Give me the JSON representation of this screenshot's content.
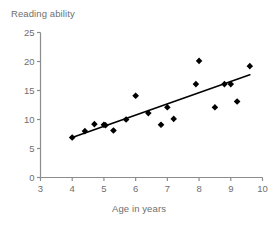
{
  "chart_data": {
    "type": "scatter",
    "title": "",
    "xlabel": "Age in years",
    "ylabel": "Reading ability",
    "xlim": [
      3,
      10
    ],
    "ylim": [
      0,
      25
    ],
    "xticks": [
      3,
      4,
      5,
      6,
      7,
      8,
      9,
      10
    ],
    "yticks": [
      0,
      5,
      10,
      15,
      20,
      25
    ],
    "grid": false,
    "legend": "none",
    "marker": "diamond",
    "marker_color": "#000000",
    "axis_color": "#8c8c8c",
    "trendline": {
      "label": "",
      "color": "#000000",
      "x": [
        4.0,
        9.6
      ],
      "y": [
        6.9,
        17.7
      ]
    },
    "points": [
      {
        "x": 4.0,
        "y": 6.9
      },
      {
        "x": 4.4,
        "y": 8.0
      },
      {
        "x": 4.7,
        "y": 9.2
      },
      {
        "x": 5.0,
        "y": 9.1
      },
      {
        "x": 5.05,
        "y": 9.0
      },
      {
        "x": 5.3,
        "y": 8.1
      },
      {
        "x": 5.7,
        "y": 10.0
      },
      {
        "x": 6.0,
        "y": 14.1
      },
      {
        "x": 6.4,
        "y": 11.1
      },
      {
        "x": 6.8,
        "y": 9.1
      },
      {
        "x": 7.0,
        "y": 12.1
      },
      {
        "x": 7.2,
        "y": 10.1
      },
      {
        "x": 7.9,
        "y": 16.1
      },
      {
        "x": 8.0,
        "y": 20.1
      },
      {
        "x": 8.5,
        "y": 12.1
      },
      {
        "x": 8.8,
        "y": 16.1
      },
      {
        "x": 9.0,
        "y": 16.1
      },
      {
        "x": 9.2,
        "y": 13.1
      },
      {
        "x": 9.6,
        "y": 19.2
      }
    ]
  }
}
